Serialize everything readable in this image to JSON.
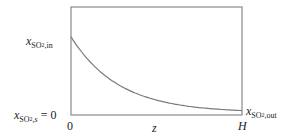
{
  "chart_data": {
    "type": "line",
    "title": "",
    "xlabel": "z",
    "ylabel": "",
    "x_ticks": [
      "0",
      "H"
    ],
    "y_ticks": [
      "x_SO2,in",
      "x_SO2,s = 0"
    ],
    "right_label": "x_SO2,out",
    "grid": false,
    "series": [
      {
        "name": "x_SO2(z)",
        "x": [
          0,
          0.1,
          0.2,
          0.3,
          0.4,
          0.5,
          0.6,
          0.7,
          0.8,
          0.9,
          1.0
        ],
        "values": [
          1.0,
          0.7,
          0.49,
          0.34,
          0.24,
          0.17,
          0.12,
          0.08,
          0.06,
          0.04,
          0.03
        ]
      }
    ],
    "xlim": [
      0,
      1
    ],
    "ylim": [
      0,
      1.38
    ]
  },
  "labels": {
    "y_top_var": "x",
    "y_top_sub": "SO",
    "y_top_subsub": "2",
    "y_top_tail": ",in",
    "y_bottom_var": "x",
    "y_bottom_sub": "SO",
    "y_bottom_subsub": "2",
    "y_bottom_tail": ",s",
    "y_bottom_eq": " = 0",
    "x_zero": "0",
    "x_mid": "z",
    "x_end": "H",
    "right_var": "x",
    "right_sub": "SO",
    "right_subsub": "2",
    "right_tail": ",out"
  },
  "colors": {
    "axis": "#888888",
    "curve": "#7a7a7a",
    "text": "#222222"
  }
}
